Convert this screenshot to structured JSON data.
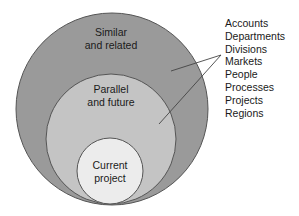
{
  "diagram": {
    "type": "nested-circles",
    "colors": {
      "outer": "#9a9a9a",
      "middle": "#c4c4c4",
      "inner": "#ececec",
      "stroke": "#555555",
      "text": "#1a1a1a"
    },
    "circles": [
      {
        "id": "outer",
        "label_line1": "Similar",
        "label_line2": "and related"
      },
      {
        "id": "middle",
        "label_line1": "Parallel",
        "label_line2": "and future"
      },
      {
        "id": "inner",
        "label_line1": "Current",
        "label_line2": "project"
      }
    ],
    "categories": [
      "Accounts",
      "Departments",
      "Divisions",
      "Markets",
      "People",
      "Processes",
      "Projects",
      "Regions"
    ]
  }
}
